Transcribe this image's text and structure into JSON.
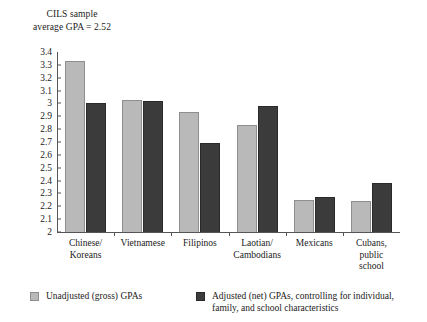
{
  "chart_data": {
    "type": "bar",
    "title": "CILS sample average GPA = 2.52",
    "title_lines": [
      "CILS sample",
      "average GPA = 2.52"
    ],
    "xlabel": "",
    "ylabel": "",
    "ylim": [
      2,
      3.4
    ],
    "grid": false,
    "legend_position": "bottom",
    "categories": [
      "Chinese/ Koreans",
      "Vietnamese",
      "Filipinos",
      "Laotian/ Cambodians",
      "Mexicans",
      "Cubans, public school"
    ],
    "category_lines": [
      [
        "Chinese/",
        "Koreans"
      ],
      [
        "Vietnamese"
      ],
      [
        "Filipinos"
      ],
      [
        "Laotian/",
        "Cambodians"
      ],
      [
        "Mexicans"
      ],
      [
        "Cubans,",
        "public",
        "school"
      ]
    ],
    "series": [
      {
        "name": "Unadjusted (gross) GPAs",
        "color": "#b9b9b9",
        "values": [
          3.33,
          3.03,
          2.93,
          2.83,
          2.25,
          2.24
        ]
      },
      {
        "name": "Adjusted (net) GPAs, controlling for individual, family, and school characteristics",
        "color": "#3b3b3b",
        "values": [
          3.0,
          3.02,
          2.69,
          2.98,
          2.27,
          2.38
        ]
      }
    ],
    "y_ticks": [
      "3.4",
      "3.3",
      "3.2",
      "3.1",
      "3",
      "2.9",
      "2.8",
      "2.7",
      "2.6",
      "2.5",
      "2.4",
      "2.3",
      "2.2",
      "2.1",
      "2"
    ],
    "legend": [
      {
        "label": "Unadjusted (gross) GPAs",
        "lines": [
          "Unadjusted (gross) GPAs"
        ],
        "swatch": "light"
      },
      {
        "label": "Adjusted (net) GPAs, controlling for individual, family, and school characteristics",
        "lines": [
          "Adjusted (net) GPAs, controlling for individual,",
          "family, and school characteristics"
        ],
        "swatch": "dark"
      }
    ]
  }
}
